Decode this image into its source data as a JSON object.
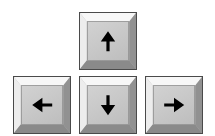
{
  "widget": {
    "name": "Keyboard arrow key cluster",
    "layout": "inverted-T",
    "background_color": "#ffffff",
    "key_count": 4
  },
  "style": {
    "face_color": "#c9c9c9",
    "bevel_top_color": "#f7f7f7",
    "bevel_left_color": "#ededed",
    "bevel_right_color": "#919191",
    "bevel_bottom_color": "#8a8a8a",
    "outline_color": "#4a4a4a",
    "glyph_color": "#000000"
  },
  "keys": [
    {
      "id": "up",
      "label": "↑",
      "icon": "arrow-up-icon",
      "direction": "up",
      "x": 79,
      "y": 12,
      "width": 58,
      "height": 58
    },
    {
      "id": "left",
      "label": "←",
      "icon": "arrow-left-icon",
      "direction": "left",
      "x": 13,
      "y": 76,
      "width": 58,
      "height": 58
    },
    {
      "id": "down",
      "label": "↓",
      "icon": "arrow-down-icon",
      "direction": "down",
      "x": 79,
      "y": 76,
      "width": 58,
      "height": 58
    },
    {
      "id": "right",
      "label": "→",
      "icon": "arrow-right-icon",
      "direction": "right",
      "x": 145,
      "y": 76,
      "width": 58,
      "height": 58
    }
  ]
}
